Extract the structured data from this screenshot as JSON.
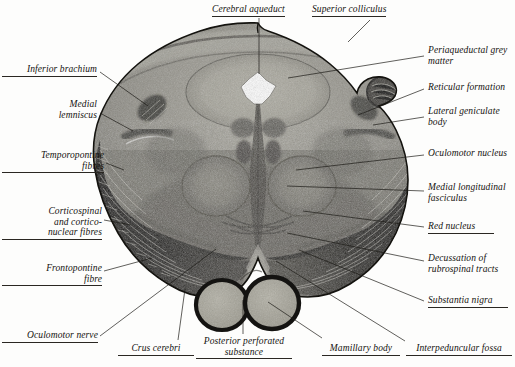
{
  "figure": {
    "background_color": "#fdfdfc",
    "ink_color": "#1d1b17",
    "specimen": {
      "stain_tone_dark": "#171717",
      "stain_tone_mid": "#6e6e6a",
      "stain_tone_light": "#b9b7ae"
    }
  },
  "labels": {
    "top": [
      {
        "id": "cerebral-aqueduct",
        "text": "Cerebral aqueduct",
        "underline": true,
        "x": 216,
        "y": 4,
        "align": "left"
      },
      {
        "id": "superior-colliculus",
        "text": "Superior colliculus",
        "underline": true,
        "x": 314,
        "y": 4,
        "align": "left"
      }
    ],
    "left": [
      {
        "id": "inferior-brachium",
        "text": "Inferior brachium",
        "underline": true,
        "x": 2,
        "y": 66,
        "align": "right",
        "width": 93
      },
      {
        "id": "medial-lemniscus",
        "text": "Medial\nlemniscus",
        "underline": false,
        "x": 2,
        "y": 101,
        "align": "right",
        "width": 93
      },
      {
        "id": "temporopontine-fibres",
        "text": "Temporopontine\nfibres",
        "underline": true,
        "x": 2,
        "y": 152,
        "align": "right",
        "width": 100
      },
      {
        "id": "corticospinal-and-cortico-nuclear-fibres",
        "text": "Corticospinal\nand cortico-\nnuclear fibres",
        "underline": true,
        "x": 2,
        "y": 208,
        "align": "right",
        "width": 98
      },
      {
        "id": "frontopontine-fibre",
        "text": "Frontopontine\nfibre",
        "underline": true,
        "x": 2,
        "y": 265,
        "align": "right",
        "width": 98
      },
      {
        "id": "oculomotor-nerve",
        "text": "Oculomotor nerve",
        "underline": true,
        "x": 2,
        "y": 333,
        "align": "right",
        "width": 94
      }
    ],
    "right": [
      {
        "id": "periaqueductal-grey-matter",
        "text": "Periaqueductal grey\nmatter",
        "underline": false,
        "x": 428,
        "y": 47,
        "align": "left"
      },
      {
        "id": "reticular-formation",
        "text": "Reticular formation",
        "underline": false,
        "x": 428,
        "y": 84,
        "align": "left"
      },
      {
        "id": "lateral-geniculate-body",
        "text": "Lateral geniculate\nbody",
        "underline": false,
        "x": 428,
        "y": 108,
        "align": "left"
      },
      {
        "id": "oculomotor-nucleus",
        "text": "Oculomotor nucleus",
        "underline": false,
        "x": 428,
        "y": 150,
        "align": "left"
      },
      {
        "id": "medial-longitudinal-fasciculus",
        "text": "Medial longitudinal\nfasciculus",
        "underline": false,
        "x": 428,
        "y": 184,
        "align": "left"
      },
      {
        "id": "red-nucleus",
        "text": "Red nucleus",
        "underline": true,
        "x": 428,
        "y": 223,
        "align": "left"
      },
      {
        "id": "decussation-of-rubrospinal-tracts",
        "text": "Decussation of\nrubrospinal tracts",
        "underline": false,
        "x": 428,
        "y": 255,
        "align": "left"
      },
      {
        "id": "substantia-nigra",
        "text": "Substantia nigra",
        "underline": true,
        "x": 428,
        "y": 297,
        "align": "left"
      }
    ],
    "bottom": [
      {
        "id": "crus-cerebri",
        "text": "Crus cerebri",
        "underline": true,
        "x": 121,
        "y": 345,
        "align": "left"
      },
      {
        "id": "posterior-perforated-substance",
        "text": "Posterior perforated\nsubstance",
        "underline": true,
        "x": 200,
        "y": 339,
        "align": "center"
      },
      {
        "id": "mamillary-body",
        "text": "Mamillary body",
        "underline": true,
        "x": 325,
        "y": 345,
        "align": "left"
      },
      {
        "id": "interpeduncular-fossa",
        "text": "Interpeduncular fossa",
        "underline": true,
        "x": 408,
        "y": 345,
        "align": "left"
      }
    ]
  },
  "leaders": [
    {
      "id": "leader-cerebral-aqueduct",
      "points": "259,18 259,74"
    },
    {
      "id": "leader-superior-colliculus",
      "points": "370,20 348,42"
    },
    {
      "id": "leader-inferior-brachium",
      "points": "100,72 148,106"
    },
    {
      "id": "leader-medial-lemniscus",
      "points": "100,113 133,131"
    },
    {
      "id": "leader-temporopontine-fibres",
      "points": "106,163 124,170"
    },
    {
      "id": "leader-corticospinal",
      "points": "104,220 131,225"
    },
    {
      "id": "leader-frontopontine-fibre",
      "points": "104,271 152,258"
    },
    {
      "id": "leader-oculomotor-nerve",
      "points": "100,336 216,249"
    },
    {
      "id": "leader-periaqueductal",
      "points": "424,56 288,78"
    },
    {
      "id": "leader-reticular-formation",
      "points": "424,89 358,115"
    },
    {
      "id": "leader-lateral-geniculate",
      "points": "424,117 373,125"
    },
    {
      "id": "leader-oculomotor-nucleus",
      "points": "424,155 296,170"
    },
    {
      "id": "leader-mlf",
      "points": "424,191 287,186"
    },
    {
      "id": "leader-red-nucleus",
      "points": "424,227 303,211"
    },
    {
      "id": "leader-decussation",
      "points": "424,261 287,233"
    },
    {
      "id": "leader-substantia-nigra",
      "points": "424,301 299,250"
    },
    {
      "id": "leader-interpeduncular-fossa",
      "points": "405,341 276,261"
    },
    {
      "id": "leader-crus-cerebri",
      "points": "178,340 185,289"
    },
    {
      "id": "leader-posterior-perforated",
      "points": "243,334 243,300"
    },
    {
      "id": "leader-mamillary-body",
      "points": "322,338 268,302"
    }
  ]
}
